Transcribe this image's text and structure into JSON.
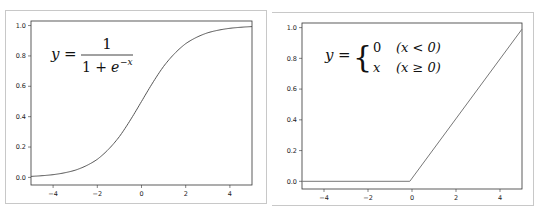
{
  "chart_data": [
    {
      "type": "line",
      "title": "",
      "annotation": "y = 1 / (1 + e^-x)",
      "annotation_parts": {
        "lhs": "y =",
        "numerator": "1",
        "denominator": "1 + e",
        "exponent": "−x"
      },
      "xlabel": "",
      "ylabel": "",
      "xlim": [
        -5,
        5
      ],
      "ylim": [
        -0.05,
        1.03
      ],
      "xticks": [
        -4,
        -2,
        0,
        2,
        4
      ],
      "xtick_labels": [
        "−4",
        "−2",
        "0",
        "2",
        "4"
      ],
      "yticks": [
        0.0,
        0.2,
        0.4,
        0.6,
        0.8,
        1.0
      ],
      "ytick_labels": [
        "0.0",
        "0.2",
        "0.4",
        "0.6",
        "0.8",
        "1.0"
      ],
      "grid": false,
      "series": [
        {
          "name": "sigmoid",
          "color": "#555555",
          "x": [
            -5,
            -4,
            -3,
            -2,
            -1,
            0,
            1,
            2,
            3,
            4,
            5
          ],
          "y": [
            0.007,
            0.018,
            0.047,
            0.119,
            0.269,
            0.5,
            0.731,
            0.881,
            0.953,
            0.982,
            0.993
          ]
        }
      ]
    },
    {
      "type": "line",
      "title": "",
      "annotation": "y = { 0 (x < 0); x (x ≥ 0) }",
      "annotation_parts": {
        "lhs": "y =",
        "case1_value": "0",
        "case1_cond": "(x < 0)",
        "case2_value": "x",
        "case2_cond": "(x ≥ 0)"
      },
      "xlabel": "",
      "ylabel": "",
      "xlim": [
        -5,
        5
      ],
      "ylim": [
        -0.05,
        1.03
      ],
      "xticks": [
        -4,
        -2,
        0,
        2,
        4
      ],
      "xtick_labels": [
        "−4",
        "−2",
        "0",
        "2",
        "4"
      ],
      "yticks": [
        0.0,
        0.2,
        0.4,
        0.6,
        0.8,
        1.0
      ],
      "ytick_labels": [
        "0.0",
        "0.2",
        "0.4",
        "0.6",
        "0.8",
        "1.0"
      ],
      "grid": false,
      "note": "Curve is a ramp: flat at 0 for x<0, then linear reaching 1.0 at x=5 (i.e. scaled relu, y = x/5 visually)",
      "series": [
        {
          "name": "piecewise",
          "color": "#777777",
          "x": [
            -5,
            -0.1,
            5
          ],
          "y": [
            0.0,
            0.0,
            0.99
          ]
        }
      ]
    }
  ]
}
